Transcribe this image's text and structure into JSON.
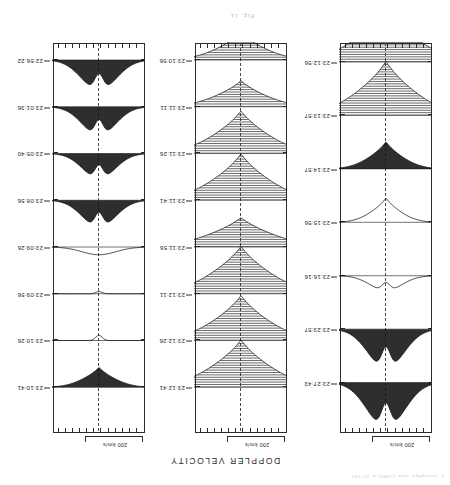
{
  "page": {
    "faint_header": "J. Astrophys. Astr. (1983) 4, 97-105",
    "figure_caption": "Fig. 1a",
    "title": "DOPPLER VELOCITY",
    "background_color": "#ffffff",
    "ink_color": "#1a1a1a",
    "orientation": "rotated-180"
  },
  "scalebar": {
    "label": "200 km/s",
    "length_px": 56
  },
  "axis": {
    "tick_count_horizontal": 13,
    "center_line_style": "dashed",
    "center_label": "line center"
  },
  "panels": [
    {
      "id": "panel-left",
      "name": "panel-left",
      "scalebar_label": "200 km/s",
      "traces": [
        {
          "time": "23:27:43",
          "shape": "double-peaked-emission",
          "amplitude": 0.92,
          "width": 0.62,
          "fill": "dark",
          "hatch": false,
          "polarity": "emission"
        },
        {
          "time": "23:23:57",
          "shape": "double-peaked-emission",
          "amplitude": 0.8,
          "width": 0.58,
          "fill": "dark",
          "hatch": false,
          "polarity": "emission"
        },
        {
          "time": "23:16:16",
          "shape": "low-double-bump",
          "amplitude": 0.3,
          "width": 0.48,
          "fill": "none",
          "hatch": false,
          "polarity": "emission"
        },
        {
          "time": "23:15:56",
          "shape": "narrow-absorption",
          "amplitude": 0.45,
          "width": 0.22,
          "fill": "none",
          "hatch": false,
          "polarity": "absorption"
        },
        {
          "time": "23:14:57",
          "shape": "narrow-absorption-dark-wing",
          "amplitude": 0.5,
          "width": 0.3,
          "fill": "dark",
          "hatch": false,
          "polarity": "absorption"
        },
        {
          "time": "23:13:57",
          "shape": "deep-broad-absorption",
          "amplitude": 1.0,
          "width": 0.78,
          "fill": "hatched",
          "hatch": true,
          "polarity": "absorption"
        },
        {
          "time": "23:12:56",
          "shape": "deep-broad-absorption",
          "amplitude": 1.0,
          "width": 0.82,
          "fill": "hatched",
          "hatch": true,
          "polarity": "absorption"
        }
      ]
    },
    {
      "id": "panel-middle",
      "name": "panel-middle",
      "scalebar_label": "200 km/s",
      "traces": [
        {
          "time": "23:12:41",
          "shape": "deep-broad-absorption",
          "amplitude": 1.0,
          "width": 0.8,
          "fill": "hatched",
          "hatch": true,
          "polarity": "absorption"
        },
        {
          "time": "23:12:26",
          "shape": "deep-broad-absorption",
          "amplitude": 0.95,
          "width": 0.74,
          "fill": "hatched",
          "hatch": true,
          "polarity": "absorption"
        },
        {
          "time": "23:12:11",
          "shape": "deep-broad-absorption",
          "amplitude": 1.0,
          "width": 0.8,
          "fill": "hatched",
          "hatch": true,
          "polarity": "absorption"
        },
        {
          "time": "23:11:56",
          "shape": "broad-shallow-absorption",
          "amplitude": 0.62,
          "width": 0.88,
          "fill": "hatched",
          "hatch": true,
          "polarity": "absorption"
        },
        {
          "time": "23:11:41",
          "shape": "deep-broad-absorption",
          "amplitude": 0.98,
          "width": 0.76,
          "fill": "hatched",
          "hatch": true,
          "polarity": "absorption"
        },
        {
          "time": "23:11:26",
          "shape": "deep-broad-absorption",
          "amplitude": 0.9,
          "width": 0.72,
          "fill": "hatched",
          "hatch": true,
          "polarity": "absorption"
        },
        {
          "time": "23:11:11",
          "shape": "moderate-absorption",
          "amplitude": 0.55,
          "width": 0.6,
          "fill": "hatched",
          "hatch": true,
          "polarity": "absorption"
        },
        {
          "time": "23:10:56",
          "shape": "moderate-absorption",
          "amplitude": 0.58,
          "width": 0.55,
          "fill": "hatched",
          "hatch": true,
          "polarity": "absorption"
        }
      ]
    },
    {
      "id": "panel-right",
      "name": "panel-right",
      "scalebar_label": "200 km/s",
      "traces": [
        {
          "time": "23:10:41",
          "shape": "narrow-dark-absorption",
          "amplitude": 0.42,
          "width": 0.26,
          "fill": "dark",
          "hatch": false,
          "polarity": "absorption"
        },
        {
          "time": "23:10:26",
          "shape": "flat-small-dip",
          "amplitude": 0.12,
          "width": 0.18,
          "fill": "none",
          "hatch": false,
          "polarity": "absorption"
        },
        {
          "time": "23:09:56",
          "shape": "flat",
          "amplitude": 0.05,
          "width": 0.15,
          "fill": "none",
          "hatch": false,
          "polarity": "absorption"
        },
        {
          "time": "23:09:26",
          "shape": "low-broad-bump",
          "amplitude": 0.18,
          "width": 0.5,
          "fill": "none",
          "hatch": false,
          "polarity": "emission"
        },
        {
          "time": "23:08:56",
          "shape": "double-peaked-emission",
          "amplitude": 0.62,
          "width": 0.52,
          "fill": "dark",
          "hatch": false,
          "polarity": "emission"
        },
        {
          "time": "23:05:40",
          "shape": "double-peaked-emission",
          "amplitude": 0.58,
          "width": 0.5,
          "fill": "dark",
          "hatch": false,
          "polarity": "emission"
        },
        {
          "time": "23:01:36",
          "shape": "double-peaked-emission",
          "amplitude": 0.66,
          "width": 0.52,
          "fill": "dark",
          "hatch": false,
          "polarity": "emission"
        },
        {
          "time": "22:56:22",
          "shape": "double-peaked-emission",
          "amplitude": 0.7,
          "width": 0.56,
          "fill": "dark",
          "hatch": false,
          "polarity": "emission"
        }
      ]
    }
  ],
  "chart_data": {
    "type": "line",
    "title": "DOPPLER VELOCITY",
    "subtitle": "Fig. 1a",
    "xlabel": "Doppler velocity (km/s)",
    "ylabel": "Time (UT)",
    "scale_annotation": "200 km/s",
    "grid": false,
    "legend": "none",
    "panel_count": 3,
    "panels": [
      {
        "name": "panel-left",
        "times": [
          "23:27:43",
          "23:23:57",
          "23:16:16",
          "23:15:56",
          "23:14:57",
          "23:13:57",
          "23:12:56"
        ],
        "amplitudes": [
          0.92,
          0.8,
          0.3,
          0.45,
          0.5,
          1.0,
          1.0
        ],
        "widths": [
          0.62,
          0.58,
          0.48,
          0.22,
          0.3,
          0.78,
          0.82
        ],
        "polarities": [
          "emission",
          "emission",
          "emission",
          "absorption",
          "absorption",
          "absorption",
          "absorption"
        ]
      },
      {
        "name": "panel-middle",
        "times": [
          "23:12:41",
          "23:12:26",
          "23:12:11",
          "23:11:56",
          "23:11:41",
          "23:11:26",
          "23:11:11",
          "23:10:56"
        ],
        "amplitudes": [
          1.0,
          0.95,
          1.0,
          0.62,
          0.98,
          0.9,
          0.55,
          0.58
        ],
        "widths": [
          0.8,
          0.74,
          0.8,
          0.88,
          0.76,
          0.72,
          0.6,
          0.55
        ],
        "polarities": [
          "absorption",
          "absorption",
          "absorption",
          "absorption",
          "absorption",
          "absorption",
          "absorption",
          "absorption"
        ]
      },
      {
        "name": "panel-right",
        "times": [
          "23:10:41",
          "23:10:26",
          "23:09:56",
          "23:09:26",
          "23:08:56",
          "23:05:40",
          "23:01:36",
          "22:56:22"
        ],
        "amplitudes": [
          0.42,
          0.12,
          0.05,
          0.18,
          0.62,
          0.58,
          0.66,
          0.7
        ],
        "widths": [
          0.26,
          0.18,
          0.15,
          0.5,
          0.52,
          0.5,
          0.52,
          0.56
        ],
        "polarities": [
          "absorption",
          "absorption",
          "absorption",
          "emission",
          "emission",
          "emission",
          "emission",
          "emission"
        ]
      }
    ]
  }
}
